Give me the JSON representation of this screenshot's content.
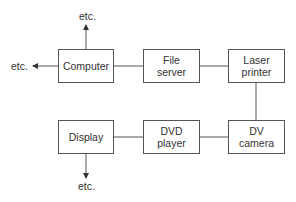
{
  "diagram": {
    "nodes": [
      {
        "id": "computer",
        "label": "Computer"
      },
      {
        "id": "file_server",
        "label": "File\nserver"
      },
      {
        "id": "laser_printer",
        "label": "Laser\nprinter"
      },
      {
        "id": "display",
        "label": "Display"
      },
      {
        "id": "dvd_player",
        "label": "DVD\nplayer"
      },
      {
        "id": "dv_camera",
        "label": "DV\ncamera"
      }
    ],
    "edges": [
      {
        "from": "computer",
        "to": "file_server"
      },
      {
        "from": "file_server",
        "to": "laser_printer"
      },
      {
        "from": "laser_printer",
        "to": "dv_camera"
      },
      {
        "from": "dv_camera",
        "to": "dvd_player"
      },
      {
        "from": "dvd_player",
        "to": "display"
      },
      {
        "from": "computer",
        "to": "etc_top",
        "arrow": true
      },
      {
        "from": "computer",
        "to": "etc_left",
        "arrow": true
      },
      {
        "from": "display",
        "to": "etc_bottom",
        "arrow": true
      }
    ],
    "etc_top": "etc.",
    "etc_left": "etc.",
    "etc_bottom": "etc.",
    "line_color": "#555555"
  }
}
